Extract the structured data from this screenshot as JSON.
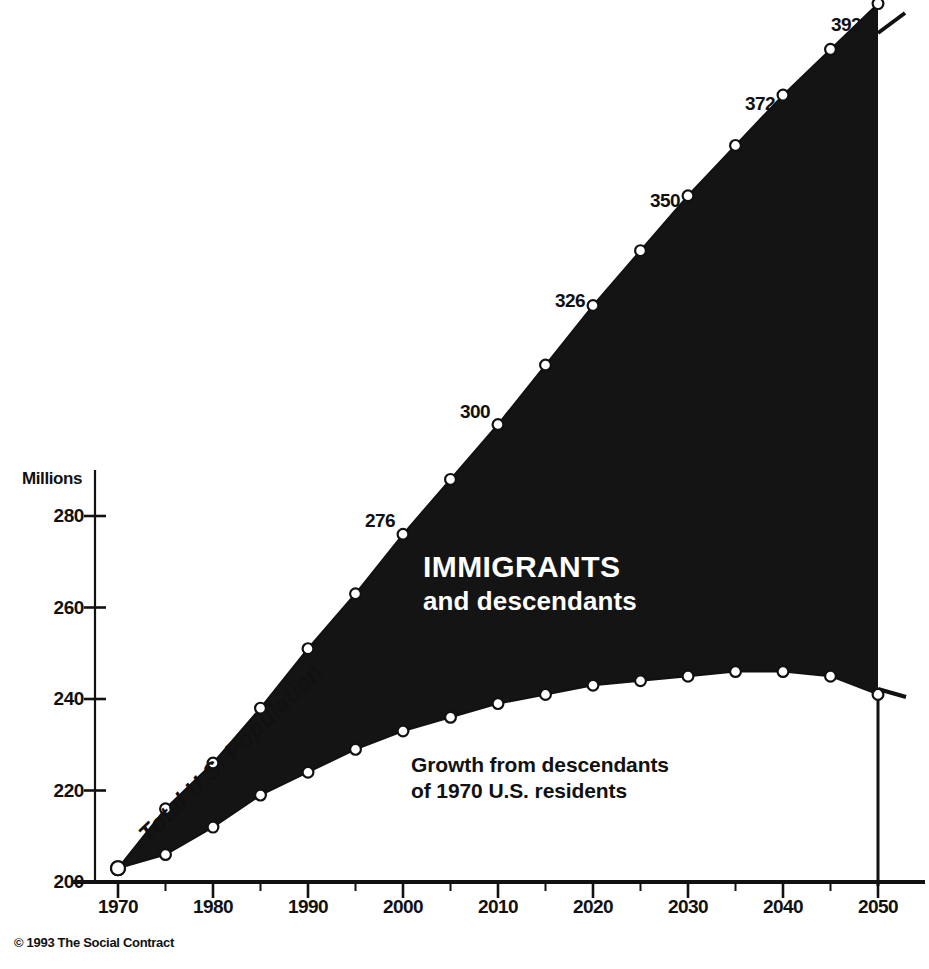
{
  "chart_data": {
    "type": "area",
    "title": "",
    "xlabel": "",
    "ylabel": "Millions",
    "xlim": [
      1970,
      2050
    ],
    "ylim": [
      200,
      400
    ],
    "grid": false,
    "legend": "none",
    "x": [
      1970,
      1975,
      1980,
      1985,
      1990,
      1995,
      2000,
      2005,
      2010,
      2015,
      2020,
      2025,
      2030,
      2035,
      2040,
      2045,
      2050
    ],
    "series": [
      {
        "name": "Total U.S. Population",
        "values": [
          203,
          216,
          226,
          238,
          251,
          263,
          276,
          288,
          300,
          313,
          326,
          338,
          350,
          361,
          372,
          382,
          392
        ]
      },
      {
        "name": "Growth from descendants of 1970 U.S. residents",
        "values": [
          203,
          206,
          212,
          219,
          224,
          229,
          233,
          236,
          239,
          241,
          243,
          244,
          245,
          246,
          246,
          245,
          241
        ]
      }
    ],
    "y_ticks": [
      200,
      220,
      240,
      260,
      280
    ],
    "x_ticks": [
      1970,
      1980,
      1990,
      2000,
      2010,
      2020,
      2030,
      2040,
      2050
    ],
    "x_minor_ticks": [
      1975,
      1985,
      1995,
      2005,
      2015,
      2025,
      2035,
      2045
    ],
    "point_labels": [
      {
        "x": 1990,
        "value": 276,
        "text": "276"
      },
      {
        "x": 2000,
        "value": 300,
        "text": "300"
      },
      {
        "x": 2010,
        "value": 326,
        "text": "326"
      },
      {
        "x": 2020,
        "value": 350,
        "text": "350"
      },
      {
        "x": 2030,
        "value": 372,
        "text": "372"
      },
      {
        "x": 2040,
        "value": 392,
        "text": "392"
      }
    ],
    "annotations": [
      {
        "name": "immigrants",
        "line1": "IMMIGRANTS",
        "line2": "and descendants",
        "color": "#ffffff"
      },
      {
        "name": "growth",
        "line1": "Growth from descendants",
        "line2": "of 1970 U.S. residents",
        "color": "#111111"
      },
      {
        "name": "total-population",
        "text": "Total U.S. Population",
        "color": "#111111"
      }
    ]
  },
  "axes": {
    "y_unit_label": "Millions",
    "y_tick_labels": [
      "280",
      "260",
      "240",
      "220",
      "200"
    ],
    "x_tick_labels": [
      "1970",
      "1980",
      "1990",
      "2000",
      "2010",
      "2020",
      "2030",
      "2040",
      "2050"
    ]
  },
  "labels": {
    "p276": "276",
    "p300": "300",
    "p326": "326",
    "p350": "350",
    "p372": "372",
    "p392": "392"
  },
  "annotations": {
    "immigrants_line1": "IMMIGRANTS",
    "immigrants_line2": "and descendants",
    "growth_line1": "Growth from descendants",
    "growth_line2": "of 1970 U.S. residents",
    "total_population": "Total U.S. Population"
  },
  "footer": {
    "credit": "© 1993 The Social Contract"
  },
  "colors": {
    "ink": "#111111",
    "fill": "#141414",
    "paper": "#ffffff",
    "marker_face": "#ffffff"
  }
}
